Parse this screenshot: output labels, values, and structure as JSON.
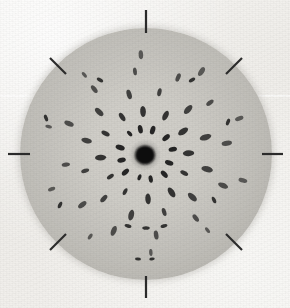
{
  "figure": {
    "title": "Laue X-ray diffraction photograph",
    "caption": "",
    "width": 290,
    "height": 308,
    "background_color": "#f2f1ee",
    "disc_color": "#cdcbc5",
    "spot_color": "#1a1a1a",
    "tick_color": "#2b2b2b"
  },
  "chart_data": {
    "type": "scatter",
    "title": "Laue X-ray diffraction photograph",
    "subtitle": "",
    "xlabel": "",
    "ylabel": "",
    "grid": false,
    "legend": "none",
    "xlim": [
      0,
      290
    ],
    "ylim": [
      0,
      308
    ],
    "description": "Single-crystal Laue diffraction pattern: dark central beam stop surrounded by concentric rings of elongated diffraction spots with approximate 12-fold rotational symmetry, recorded on a circular film disc; eight fiducial tick marks at 45 degree intervals around the film edge.",
    "detector": {
      "shape": "circle",
      "center_x": 146,
      "center_y": 154,
      "radius": 126
    },
    "beam_stop": {
      "center_x": 145,
      "center_y": 155,
      "radius_x": 10,
      "radius_y": 9.5,
      "halo_radius": 16,
      "label": "direct-beam stop"
    },
    "fiducial_ticks": [
      {
        "name": "north",
        "angle_deg": 90,
        "x1": 146,
        "y1": 10,
        "x2": 146,
        "y2": 33
      },
      {
        "name": "northeast",
        "angle_deg": 45,
        "x1": 242,
        "y1": 58,
        "x2": 226,
        "y2": 74
      },
      {
        "name": "east",
        "angle_deg": 0,
        "x1": 283,
        "y1": 154,
        "x2": 262,
        "y2": 154
      },
      {
        "name": "southeast",
        "angle_deg": -45,
        "x1": 242,
        "y1": 250,
        "x2": 226,
        "y2": 234
      },
      {
        "name": "south",
        "angle_deg": -90,
        "x1": 146,
        "y1": 298,
        "x2": 146,
        "y2": 276
      },
      {
        "name": "southwest",
        "angle_deg": -135,
        "x1": 50,
        "y1": 250,
        "x2": 66,
        "y2": 234
      },
      {
        "name": "west",
        "angle_deg": 180,
        "x1": 8,
        "y1": 154,
        "x2": 30,
        "y2": 154
      },
      {
        "name": "northwest",
        "angle_deg": 135,
        "x1": 50,
        "y1": 58,
        "x2": 66,
        "y2": 74
      }
    ],
    "rings": [
      {
        "name": "ring-1",
        "radius_px": 26,
        "spot_count": 12,
        "spot_length": 7.5,
        "spot_width": 4.2,
        "start_angle_deg": 12
      },
      {
        "name": "ring-2",
        "radius_px": 44,
        "spot_count": 12,
        "spot_length": 9.0,
        "spot_width": 4.6,
        "start_angle_deg": 3
      },
      {
        "name": "ring-3",
        "radius_px": 62,
        "spot_count": 12,
        "spot_length": 9.5,
        "spot_width": 4.8,
        "start_angle_deg": 17
      },
      {
        "name": "ring-4",
        "radius_px": 82,
        "spot_count": 12,
        "spot_length": 9.0,
        "spot_width": 4.5,
        "start_angle_deg": 8
      },
      {
        "name": "ring-5",
        "radius_px": 100,
        "spot_count": 10,
        "spot_length": 8.0,
        "spot_width": 4.0,
        "start_angle_deg": 21
      }
    ],
    "extra_spots": [
      {
        "x": 146,
        "y": 228,
        "length": 7.5,
        "width": 3.6,
        "angle_deg": 0
      },
      {
        "x": 128,
        "y": 226,
        "length": 7.0,
        "width": 3.4,
        "angle_deg": 15
      },
      {
        "x": 164,
        "y": 226,
        "length": 7.0,
        "width": 3.4,
        "angle_deg": -15
      },
      {
        "x": 138,
        "y": 259,
        "length": 6.0,
        "width": 3.0,
        "angle_deg": 5
      },
      {
        "x": 152,
        "y": 259,
        "length": 5.5,
        "width": 2.8,
        "angle_deg": -5
      },
      {
        "x": 46,
        "y": 118,
        "length": 7.0,
        "width": 3.6,
        "angle_deg": 70
      },
      {
        "x": 228,
        "y": 122,
        "length": 7.0,
        "width": 3.6,
        "angle_deg": -70
      },
      {
        "x": 60,
        "y": 205,
        "length": 7.0,
        "width": 3.6,
        "angle_deg": 115
      },
      {
        "x": 214,
        "y": 200,
        "length": 7.0,
        "width": 3.6,
        "angle_deg": -115
      },
      {
        "x": 100,
        "y": 80,
        "length": 7.0,
        "width": 3.6,
        "angle_deg": 30
      },
      {
        "x": 192,
        "y": 80,
        "length": 7.0,
        "width": 3.6,
        "angle_deg": -30
      }
    ],
    "notes": [
      "Spots are elongated radially outward, consistent with a Laue transmission pattern.",
      "Intensity falls off with increasing ring radius.",
      "Outermost visible ring lies well inside the film edge."
    ]
  }
}
